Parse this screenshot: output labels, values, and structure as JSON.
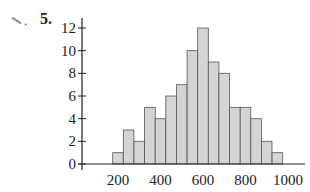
{
  "problem": {
    "number": "5.",
    "icon": "pencil-icon"
  },
  "chart_data": {
    "type": "bar",
    "title": "",
    "xlabel": "",
    "ylabel": "",
    "bin_width": 50,
    "categories": [
      200,
      250,
      300,
      350,
      400,
      450,
      500,
      550,
      600,
      650,
      700,
      750,
      800,
      850,
      900,
      950
    ],
    "values": [
      1,
      3,
      2,
      5,
      4,
      6,
      7,
      10,
      12,
      9,
      8,
      5,
      5,
      4,
      2,
      1
    ],
    "x_ticks": [
      "200",
      "400",
      "600",
      "800",
      "1000"
    ],
    "y_ticks": [
      "0",
      "2",
      "4",
      "6",
      "8",
      "10",
      "12"
    ],
    "ylim": [
      0,
      12
    ],
    "xlim": [
      100,
      1050
    ],
    "grid": false,
    "legend": null,
    "bar_fill": "#d4d4d4",
    "bar_stroke": "#555555"
  }
}
